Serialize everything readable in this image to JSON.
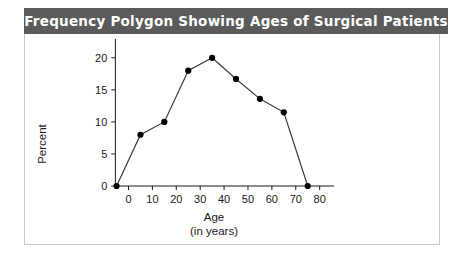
{
  "figure": {
    "title": "Frequency Polygon Showing Ages of Surgical Patients",
    "banner_color": "#5b5b5b",
    "banner_text_color": "#ffffff",
    "card_border_color": "#c9c9c9"
  },
  "chart_data": {
    "type": "line",
    "title": "Frequency Polygon Showing Ages of Surgical Patients",
    "xlabel": "Age",
    "xlabel_sub": "(in years)",
    "ylabel": "Percent",
    "x": [
      -5,
      5,
      15,
      25,
      35,
      45,
      55,
      65,
      75
    ],
    "values": [
      0,
      8,
      10,
      18,
      20,
      16.7,
      13.6,
      11.5,
      0
    ],
    "xlim": [
      -9,
      86
    ],
    "ylim": [
      0,
      22
    ],
    "xticks": [
      0,
      10,
      20,
      30,
      40,
      50,
      60,
      70,
      80
    ],
    "xticklabels": [
      "0",
      "10",
      "20",
      "30",
      "40",
      "50",
      "60",
      "70",
      "80"
    ],
    "yticks": [
      0,
      5,
      10,
      15,
      20
    ],
    "yticklabels": [
      "0",
      "5",
      "10",
      "15",
      "20"
    ],
    "grid": false,
    "legend": null,
    "marker": "filled-circle",
    "marker_color": "#000000",
    "line_color": "#3a3a3a"
  }
}
